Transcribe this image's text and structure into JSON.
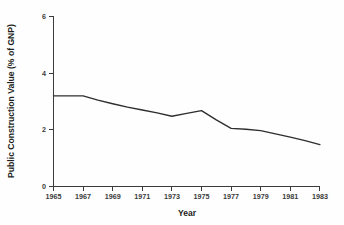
{
  "chart_data": {
    "type": "line",
    "title": "",
    "xlabel": "Year",
    "ylabel": "Public Construction Value (% of GNP)",
    "xlim": [
      1965,
      1983
    ],
    "ylim": [
      0,
      6
    ],
    "grid": false,
    "legend": null,
    "xticks": [
      1965,
      1967,
      1969,
      1971,
      1973,
      1975,
      1977,
      1979,
      1981,
      1983
    ],
    "xtick_labels": [
      "1965",
      "1967",
      "1969",
      "1971",
      "1973",
      "1975",
      "1977",
      "1979",
      "1981",
      "1983"
    ],
    "yticks": [
      0,
      2,
      4,
      6
    ],
    "ytick_labels": [
      "0",
      "2",
      "4",
      "6"
    ],
    "line_color": "#2e2e2e",
    "x": [
      1965,
      1966,
      1967,
      1968,
      1969,
      1970,
      1971,
      1972,
      1973,
      1974,
      1975,
      1976,
      1977,
      1978,
      1979,
      1980,
      1981,
      1982,
      1983
    ],
    "values": [
      3.2,
      3.2,
      3.2,
      3.05,
      2.92,
      2.8,
      2.7,
      2.6,
      2.48,
      2.58,
      2.68,
      2.35,
      2.05,
      2.02,
      1.97,
      1.86,
      1.74,
      1.62,
      1.48
    ],
    "series": [
      {
        "name": "Public Construction Value (% of GNP)",
        "values": [
          3.2,
          3.2,
          3.2,
          3.05,
          2.92,
          2.8,
          2.7,
          2.6,
          2.48,
          2.58,
          2.68,
          2.35,
          2.05,
          2.02,
          1.97,
          1.86,
          1.74,
          1.62,
          1.48
        ]
      }
    ]
  },
  "figure": {
    "background_color": "#fefefe",
    "axis_color": "#3b3b3b",
    "text_color": "#231f20"
  }
}
